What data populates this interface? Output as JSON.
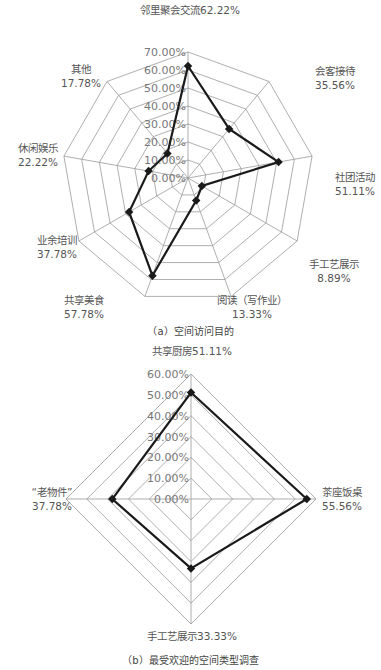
{
  "colors": {
    "grid": "#9a9a9a",
    "series": "#1a1a1a",
    "label": "#555555",
    "tick": "#777777"
  },
  "chart_data": [
    {
      "type": "radar",
      "title": "（a）空间访问目的",
      "categories": [
        "邻里聚会交流",
        "会客接待",
        "社团活动",
        "手工艺展示",
        "阅读（写作业）",
        "共享美食",
        "业余培训",
        "休闲娱乐",
        "其他"
      ],
      "values": [
        62.22,
        35.56,
        51.11,
        8.89,
        13.33,
        57.78,
        37.78,
        22.22,
        17.78
      ],
      "value_labels": [
        "62.22%",
        "35.56%",
        "51.11%",
        "8.89%",
        "13.33%",
        "57.78%",
        "37.78%",
        "22.22%",
        "17.78%"
      ],
      "rlim": [
        0,
        70
      ],
      "ticks": [
        "0.00%",
        "10.00%",
        "20.00%",
        "30.00%",
        "40.00%",
        "50.00%",
        "60.00%",
        "70.00%"
      ],
      "grid": true,
      "legend": "none"
    },
    {
      "type": "radar",
      "title": "（b）最受欢迎的空间类型调查",
      "categories": [
        "共享厨房",
        "茶座饭桌",
        "手工艺展示",
        "“老物件”"
      ],
      "values": [
        51.11,
        55.56,
        33.33,
        37.78
      ],
      "value_labels": [
        "51.11%",
        "55.56%",
        "33.33%",
        "37.78%"
      ],
      "rlim": [
        0,
        60
      ],
      "ticks": [
        "0.00%",
        "10.00%",
        "20.00%",
        "30.00%",
        "40.00%",
        "50.00%",
        "60.00%"
      ],
      "grid": true,
      "legend": "none"
    }
  ],
  "captions": {
    "a": "（a）空间访问目的",
    "b": "（b）最受欢迎的空间类型调查"
  }
}
